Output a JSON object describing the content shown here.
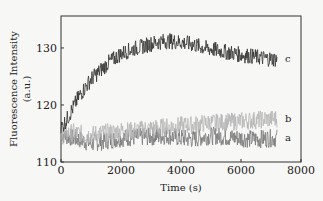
{
  "chart_data": {
    "type": "line",
    "title": "",
    "xlabel": "Time (s)",
    "ylabel_line1": "Fluorescence Intensity",
    "ylabel_line2": "(a.u.)",
    "xlim": [
      0,
      8000
    ],
    "ylim": [
      110,
      135.6
    ],
    "xticks": [
      0,
      2000,
      4000,
      6000,
      8000
    ],
    "xtick_labels": [
      "0",
      "2000",
      "4000",
      "6000",
      "8000"
    ],
    "yticks": [
      110,
      120,
      130
    ],
    "ytick_labels": [
      "110",
      "120",
      "130"
    ],
    "grid": false,
    "legend_position": "inline-right",
    "x": [
      0,
      200,
      400,
      600,
      800,
      1000,
      1200,
      1400,
      1600,
      1800,
      2000,
      2400,
      2800,
      3200,
      3600,
      4000,
      4400,
      4800,
      5200,
      5600,
      6000,
      6400,
      6800,
      7200
    ],
    "series": [
      {
        "name": "a",
        "color": "#7a7a7a",
        "values": [
          115.0,
          114.5,
          114.2,
          114.0,
          113.6,
          113.2,
          113.5,
          113.6,
          113.8,
          114.0,
          114.2,
          114.3,
          114.4,
          114.5,
          114.6,
          114.2,
          114.0,
          114.5,
          114.6,
          114.3,
          114.2,
          114.0,
          114.1,
          114.2
        ]
      },
      {
        "name": "b",
        "color": "#b5b5b5",
        "values": [
          114.5,
          115.0,
          115.2,
          115.0,
          114.8,
          114.8,
          115.0,
          115.1,
          115.2,
          115.3,
          115.5,
          115.5,
          115.8,
          116.0,
          116.2,
          116.4,
          116.5,
          116.8,
          116.9,
          117.0,
          117.2,
          117.3,
          117.5,
          117.6
        ]
      },
      {
        "name": "c",
        "color": "#333333",
        "values": [
          116.0,
          117.5,
          119.5,
          121.5,
          123.0,
          124.5,
          125.5,
          126.5,
          127.5,
          128.2,
          129.0,
          129.8,
          130.4,
          131.0,
          131.2,
          131.0,
          130.6,
          130.0,
          129.6,
          129.2,
          128.8,
          128.5,
          128.2,
          128.0
        ]
      }
    ]
  }
}
